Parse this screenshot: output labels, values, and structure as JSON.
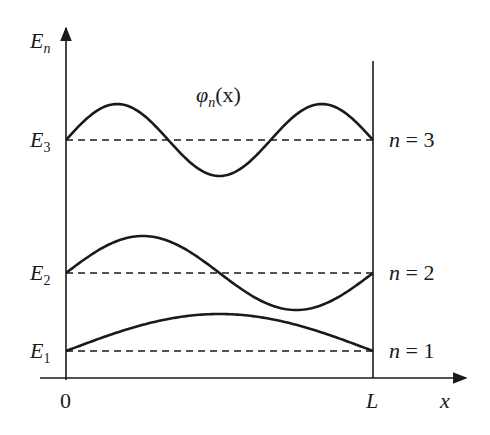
{
  "diagram": {
    "axis": {
      "y_label_base": "E",
      "y_label_sub": "n",
      "x_label": "x",
      "origin_label": "0",
      "wall_label": "L"
    },
    "function_label": {
      "base": "φ",
      "sub": "n",
      "arg": "(x)"
    },
    "levels": [
      {
        "n": 1,
        "energy_base": "E",
        "energy_sub": "1",
        "state_label": "n = 1",
        "half_wavelengths": 1
      },
      {
        "n": 2,
        "energy_base": "E",
        "energy_sub": "2",
        "state_label": "n = 2",
        "half_wavelengths": 2
      },
      {
        "n": 3,
        "energy_base": "E",
        "energy_sub": "3",
        "state_label": "n = 3",
        "half_wavelengths": 3
      }
    ],
    "colors": {
      "ink": "#1a1a1a",
      "background": "#ffffff"
    }
  }
}
